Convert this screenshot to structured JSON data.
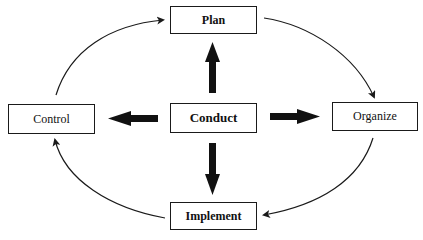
{
  "diagram": {
    "type": "management-cycle",
    "colors": {
      "stroke": "#1a1a1a",
      "text": "#111111",
      "background": "#ffffff"
    },
    "nodes": {
      "plan": {
        "label": "Plan",
        "x": 170,
        "y": 6,
        "w": 87,
        "h": 28
      },
      "conduct": {
        "label": "Conduct",
        "x": 170,
        "y": 103,
        "w": 87,
        "h": 30
      },
      "control": {
        "label": "Control",
        "x": 8,
        "y": 104,
        "w": 87,
        "h": 30
      },
      "organize": {
        "label": "Organize",
        "x": 332,
        "y": 102,
        "w": 86,
        "h": 29
      },
      "implement": {
        "label": "Implement",
        "x": 170,
        "y": 202,
        "w": 87,
        "h": 28
      }
    },
    "edges": [
      {
        "from": "Conduct",
        "to": "Plan",
        "style": "thick"
      },
      {
        "from": "Conduct",
        "to": "Organize",
        "style": "thick"
      },
      {
        "from": "Conduct",
        "to": "Implement",
        "style": "thick"
      },
      {
        "from": "Conduct",
        "to": "Control",
        "style": "thick"
      },
      {
        "from": "Control",
        "to": "Plan",
        "style": "curved-thin"
      },
      {
        "from": "Plan",
        "to": "Organize",
        "style": "curved-thin"
      },
      {
        "from": "Organize",
        "to": "Implement",
        "style": "curved-thin"
      },
      {
        "from": "Implement",
        "to": "Control",
        "style": "curved-thin"
      }
    ]
  }
}
